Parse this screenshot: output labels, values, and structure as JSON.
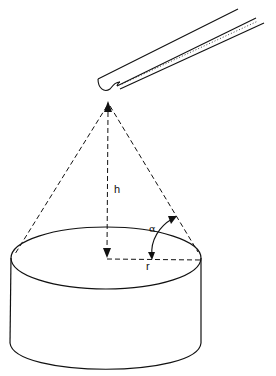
{
  "figure": {
    "labels": {
      "height": "h",
      "angle": "α",
      "radius": "r"
    },
    "colors": {
      "stroke": "#111111",
      "background": "#ffffff"
    }
  }
}
